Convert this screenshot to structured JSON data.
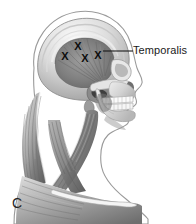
{
  "figure": {
    "panel_label": "C",
    "type": "anatomical-illustration",
    "view": "lateral head and neck",
    "style": "grayscale medical illustration",
    "background_color": "#ffffff"
  },
  "labels": [
    {
      "id": "temporalis",
      "text": "Temporalis",
      "color": "#1a1a1a",
      "leader_line": {
        "from_x": 103,
        "from_y": 51,
        "to_x": 133,
        "to_y": 51,
        "color": "#1a1a1a"
      }
    }
  ],
  "markers": {
    "glyph": "X",
    "color": "#0d0d0d",
    "meaning": "trigger point",
    "count": 4,
    "points": [
      {
        "x": 78,
        "y": 46
      },
      {
        "x": 65,
        "y": 56
      },
      {
        "x": 85,
        "y": 58
      },
      {
        "x": 98,
        "y": 55
      }
    ]
  },
  "anatomy": {
    "structures": [
      "cranium",
      "temporal fossa",
      "temporalis muscle",
      "zygomatic arch",
      "maxilla",
      "mandible",
      "teeth",
      "sternocleidomastoid",
      "trapezius",
      "clavicle",
      "skin profile outline"
    ]
  },
  "palette": {
    "outline": "#4d4d4d",
    "muscle_dark": "#555555",
    "muscle_mid": "#8a8a8a",
    "muscle_light": "#bdbdbd",
    "bone_light": "#e2e2e2",
    "bone_mid": "#c2c2c2",
    "shadow": "#3a3a3a",
    "highlight": "#f2f2f2"
  }
}
